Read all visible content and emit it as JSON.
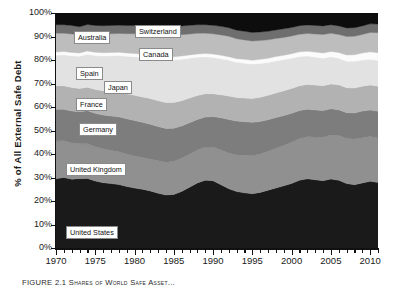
{
  "figure": {
    "caption": "FIGURE 2.1  Shares of World Safe Asset...",
    "ylabel": "% of All External Safe Debt"
  },
  "axes": {
    "y_ticks": [
      "0%",
      "10%",
      "20%",
      "30%",
      "40%",
      "50%",
      "60%",
      "70%",
      "80%",
      "90%",
      "100%"
    ],
    "y_values": [
      0,
      10,
      20,
      30,
      40,
      50,
      60,
      70,
      80,
      90,
      100
    ],
    "x_ticks": [
      "1970",
      "1975",
      "1980",
      "1985",
      "1990",
      "1995",
      "2000",
      "2005",
      "2010"
    ],
    "x_tick_values": [
      1970,
      1975,
      1980,
      1985,
      1990,
      1995,
      2000,
      2005,
      2010
    ],
    "x_minor_step": 1
  },
  "series_labels": [
    {
      "name": "Australia",
      "text": "Australia",
      "x": 18,
      "y": 18
    },
    {
      "name": "Switzerland",
      "text": "Switzerland",
      "x": 79,
      "y": 12
    },
    {
      "name": "Canada",
      "text": "Canada",
      "x": 83,
      "y": 35
    },
    {
      "name": "Spain",
      "text": "Spain",
      "x": 20,
      "y": 54
    },
    {
      "name": "Japan",
      "text": "Japan",
      "x": 48,
      "y": 68
    },
    {
      "name": "France",
      "text": "France",
      "x": 20,
      "y": 85
    },
    {
      "name": "Germany",
      "text": "Germany",
      "x": 23,
      "y": 110
    },
    {
      "name": "United Kingdom",
      "text": "United Kingdom",
      "x": 10,
      "y": 150
    },
    {
      "name": "United States",
      "text": "United States",
      "x": 10,
      "y": 213
    }
  ],
  "colors": {
    "united_states": "#1a1a1a",
    "united_kingdom": "#909090",
    "germany": "#7d7d7d",
    "france": "#b2b2b2",
    "japan": "#e2e2e2",
    "spain": "#fbfbfb",
    "canada": "#bdbdbd",
    "australia": "#6e6e6e",
    "switzerland": "#0d0d0d",
    "axis": "#111111",
    "text": "#1a1a1a"
  },
  "chart_data": {
    "type": "area",
    "stacked": true,
    "normalized": true,
    "xlabel": "",
    "ylabel": "% of All External Safe Debt",
    "xlim": [
      1970,
      2011
    ],
    "ylim": [
      0,
      100
    ],
    "grid": false,
    "legend": "inline-labels",
    "x": [
      1970,
      1971,
      1972,
      1973,
      1974,
      1975,
      1976,
      1977,
      1978,
      1979,
      1980,
      1981,
      1982,
      1983,
      1984,
      1985,
      1986,
      1987,
      1988,
      1989,
      1990,
      1991,
      1992,
      1993,
      1994,
      1995,
      1996,
      1997,
      1998,
      1999,
      2000,
      2001,
      2002,
      2003,
      2004,
      2005,
      2006,
      2007,
      2008,
      2009,
      2010,
      2011
    ],
    "series": [
      {
        "name": "United States",
        "color": "#1a1a1a",
        "values": [
          29.5,
          30.0,
          29.3,
          29.8,
          29.6,
          28.5,
          27.8,
          27.4,
          27.0,
          26.2,
          25.5,
          25.0,
          24.3,
          23.3,
          22.6,
          23.0,
          24.5,
          26.6,
          28.8,
          30.2,
          30.0,
          28.0,
          26.2,
          25.0,
          24.4,
          24.0,
          24.6,
          25.6,
          26.5,
          27.5,
          28.6,
          30.0,
          30.6,
          30.2,
          29.8,
          30.5,
          30.0,
          28.5,
          28.0,
          28.8,
          29.5,
          29.0
        ]
      },
      {
        "name": "United Kingdom",
        "color": "#909090",
        "values": [
          16.0,
          15.6,
          15.4,
          15.0,
          14.8,
          14.6,
          14.4,
          14.2,
          14.0,
          13.8,
          13.6,
          13.5,
          13.6,
          13.8,
          14.0,
          14.2,
          14.4,
          14.5,
          14.6,
          14.8,
          15.0,
          15.4,
          15.8,
          16.2,
          16.5,
          16.8,
          17.0,
          17.3,
          17.6,
          17.9,
          18.2,
          18.4,
          18.6,
          18.9,
          19.2,
          19.5,
          19.8,
          20.0,
          20.2,
          20.0,
          19.8,
          19.6
        ]
      },
      {
        "name": "Germany",
        "color": "#7d7d7d",
        "values": [
          13.5,
          13.4,
          13.6,
          13.8,
          14.0,
          14.2,
          14.4,
          14.6,
          14.8,
          15.0,
          15.2,
          15.0,
          14.8,
          14.6,
          14.4,
          14.2,
          14.0,
          13.8,
          13.6,
          13.4,
          13.6,
          14.2,
          14.8,
          15.0,
          15.0,
          14.8,
          14.4,
          14.0,
          13.6,
          13.2,
          12.8,
          12.4,
          12.2,
          12.0,
          11.8,
          11.6,
          11.4,
          11.4,
          11.6,
          11.8,
          11.8,
          11.9
        ]
      },
      {
        "name": "France",
        "color": "#b2b2b2",
        "values": [
          10.0,
          10.0,
          10.0,
          10.0,
          10.0,
          10.2,
          10.3,
          10.4,
          10.5,
          10.6,
          10.7,
          10.8,
          10.9,
          11.0,
          11.0,
          11.0,
          10.9,
          10.8,
          10.6,
          10.4,
          10.2,
          10.2,
          10.3,
          10.4,
          10.5,
          10.6,
          10.7,
          10.8,
          10.9,
          11.0,
          11.0,
          11.0,
          11.0,
          11.0,
          11.0,
          11.0,
          11.0,
          11.0,
          11.0,
          11.0,
          11.0,
          11.0
        ]
      },
      {
        "name": "Japan",
        "color": "#e2e2e2",
        "values": [
          13.0,
          13.2,
          13.5,
          13.8,
          14.0,
          14.4,
          14.8,
          15.2,
          15.6,
          16.0,
          16.4,
          16.8,
          17.2,
          17.6,
          18.0,
          18.2,
          18.0,
          17.5,
          17.0,
          16.5,
          16.2,
          16.0,
          15.8,
          15.6,
          15.4,
          15.2,
          15.0,
          14.6,
          14.2,
          13.8,
          13.4,
          13.0,
          12.6,
          12.4,
          12.2,
          12.0,
          11.8,
          11.8,
          11.8,
          11.6,
          11.4,
          11.4
        ]
      },
      {
        "name": "Spain",
        "color": "#fbfbfb",
        "values": [
          1.4,
          1.4,
          1.4,
          1.4,
          1.4,
          1.4,
          1.4,
          1.4,
          1.4,
          1.4,
          1.4,
          1.4,
          1.4,
          1.4,
          1.4,
          1.4,
          1.4,
          1.4,
          1.4,
          1.4,
          1.5,
          1.5,
          1.6,
          1.6,
          1.7,
          1.7,
          1.8,
          1.8,
          1.9,
          1.9,
          2.0,
          2.0,
          2.1,
          2.2,
          2.3,
          2.4,
          2.5,
          2.7,
          2.9,
          3.1,
          3.3,
          3.4
        ]
      },
      {
        "name": "Canada",
        "color": "#bdbdbd",
        "values": [
          8.0,
          7.8,
          7.9,
          7.8,
          7.8,
          7.9,
          8.0,
          8.0,
          8.0,
          8.2,
          8.4,
          8.6,
          8.8,
          9.0,
          9.2,
          9.2,
          9.2,
          9.2,
          9.2,
          9.1,
          9.0,
          9.0,
          9.0,
          8.8,
          8.6,
          8.5,
          8.3,
          8.2,
          8.0,
          7.9,
          7.8,
          7.8,
          7.8,
          8.0,
          8.2,
          8.0,
          8.0,
          8.2,
          8.2,
          8.2,
          8.6,
          8.9
        ]
      },
      {
        "name": "Australia",
        "color": "#6e6e6e",
        "values": [
          3.6,
          3.6,
          3.6,
          3.5,
          3.5,
          3.5,
          3.5,
          3.5,
          3.5,
          3.5,
          3.5,
          3.6,
          3.7,
          3.8,
          3.8,
          3.8,
          3.8,
          3.8,
          3.8,
          3.8,
          3.8,
          3.8,
          3.8,
          3.8,
          3.8,
          3.8,
          3.8,
          3.8,
          3.8,
          3.8,
          3.8,
          3.8,
          3.8,
          3.8,
          3.8,
          3.8,
          3.8,
          3.8,
          3.8,
          3.8,
          3.8,
          3.8
        ]
      },
      {
        "name": "Switzerland",
        "color": "#0d0d0d",
        "values": [
          5.0,
          5.0,
          5.3,
          5.9,
          4.9,
          5.3,
          5.4,
          5.3,
          5.2,
          5.3,
          5.3,
          5.3,
          5.3,
          5.5,
          5.8,
          5.8,
          5.6,
          5.4,
          5.2,
          5.2,
          5.5,
          5.9,
          6.5,
          7.6,
          8.1,
          8.6,
          8.4,
          8.1,
          7.5,
          7.0,
          6.4,
          5.6,
          5.3,
          5.5,
          5.7,
          5.2,
          5.7,
          6.6,
          6.5,
          5.7,
          4.8,
          4.9
        ]
      }
    ]
  }
}
